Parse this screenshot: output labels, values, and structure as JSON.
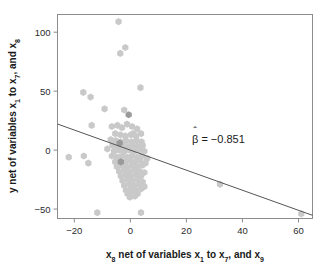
{
  "chart_data": {
    "type": "scatter",
    "title": "",
    "subtitle": "",
    "xlabel_parts": [
      "x",
      "8",
      " net of variables ",
      "x",
      "1",
      " to ",
      "x",
      "7",
      ", and ",
      "x",
      "9"
    ],
    "xlabel_text": "x8 net of variables x1 to x7, and x9",
    "ylabel_parts": [
      "y net of variables ",
      "x",
      "1",
      " to ",
      "x",
      "7",
      ", and ",
      "x",
      "8"
    ],
    "ylabel_text": "y net of variables x1 to x7, and x8",
    "xlim": [
      -26,
      65
    ],
    "ylim": [
      -58,
      115
    ],
    "xticks": [
      -20,
      0,
      20,
      40,
      60
    ],
    "xtick_labels": [
      "−20",
      "0",
      "20",
      "40",
      "60"
    ],
    "yticks": [
      -50,
      0,
      50,
      100
    ],
    "ytick_labels": [
      "−50",
      "0",
      "50",
      "100"
    ],
    "grid": false,
    "legend": "none",
    "marker_shape": "hexagon",
    "marker_color": "#c9c9c9",
    "marker_color_dark": "#9a9a9a",
    "frame_color": "#8c8c8c",
    "line_color": "#555555",
    "annotation": {
      "text": "β̂ = −0.851",
      "beta_symbol": "β",
      "hat": "̂",
      "equals": "=",
      "value": "−0.851",
      "x": 22,
      "y": 6
    },
    "fit_line": {
      "slope": -0.851,
      "intercept": 0.0,
      "x_start": -26,
      "y_start": 22.1,
      "x_end": 65,
      "y_end": -55.3
    },
    "points": [
      [
        -4.2,
        109
      ],
      [
        -3.6,
        82
      ],
      [
        -1.8,
        87
      ],
      [
        3.6,
        53
      ],
      [
        -16.8,
        49
      ],
      [
        -14.2,
        45
      ],
      [
        -9.2,
        35
      ],
      [
        -2.2,
        34
      ],
      [
        -13.8,
        21
      ],
      [
        -6.6,
        20
      ],
      [
        -4.6,
        21
      ],
      [
        -3.0,
        19
      ],
      [
        -1.2,
        22
      ],
      [
        0.6,
        20
      ],
      [
        2.4,
        18
      ],
      [
        1.0,
        14
      ],
      [
        -5.4,
        14
      ],
      [
        -3.6,
        13
      ],
      [
        -1.8,
        12
      ],
      [
        0.2,
        13
      ],
      [
        2.0,
        12
      ],
      [
        3.8,
        14
      ],
      [
        -7.0,
        9
      ],
      [
        -5.2,
        8
      ],
      [
        -3.4,
        7
      ],
      [
        -1.6,
        8
      ],
      [
        0.4,
        7
      ],
      [
        2.2,
        8
      ],
      [
        4.0,
        7
      ],
      [
        -6.4,
        4
      ],
      [
        -4.6,
        3
      ],
      [
        -2.8,
        4
      ],
      [
        -1.0,
        3
      ],
      [
        0.8,
        4
      ],
      [
        2.6,
        3
      ],
      [
        4.4,
        4
      ],
      [
        -8.2,
        1
      ],
      [
        -5.8,
        -1
      ],
      [
        -4.0,
        0
      ],
      [
        -2.2,
        -1
      ],
      [
        -0.4,
        0
      ],
      [
        1.4,
        -1
      ],
      [
        3.2,
        0
      ],
      [
        5.0,
        -1
      ],
      [
        -22.0,
        -6
      ],
      [
        -16.6,
        -5
      ],
      [
        -15.0,
        -11
      ],
      [
        -6.6,
        -5
      ],
      [
        -4.8,
        -6
      ],
      [
        -3.0,
        -5
      ],
      [
        -1.2,
        -6
      ],
      [
        0.6,
        -5
      ],
      [
        2.4,
        -6
      ],
      [
        4.2,
        -5
      ],
      [
        6.0,
        -7
      ],
      [
        -5.4,
        -10
      ],
      [
        -3.6,
        -9
      ],
      [
        -1.8,
        -10
      ],
      [
        0.0,
        -9
      ],
      [
        1.8,
        -10
      ],
      [
        3.6,
        -9
      ],
      [
        5.4,
        -11
      ],
      [
        -4.8,
        -14
      ],
      [
        -3.0,
        -13
      ],
      [
        -1.2,
        -14
      ],
      [
        0.6,
        -13
      ],
      [
        2.4,
        -14
      ],
      [
        4.2,
        -13
      ],
      [
        -4.0,
        -18
      ],
      [
        -2.2,
        -17
      ],
      [
        -0.4,
        -18
      ],
      [
        1.4,
        -17
      ],
      [
        3.2,
        -18
      ],
      [
        5.0,
        -19
      ],
      [
        -3.4,
        -22
      ],
      [
        -1.6,
        -21
      ],
      [
        0.2,
        -22
      ],
      [
        2.0,
        -21
      ],
      [
        3.8,
        -22
      ],
      [
        -2.8,
        -26
      ],
      [
        -1.0,
        -25
      ],
      [
        0.8,
        -26
      ],
      [
        2.6,
        -25
      ],
      [
        4.4,
        -27
      ],
      [
        -2.2,
        -30
      ],
      [
        -0.4,
        -29
      ],
      [
        1.4,
        -30
      ],
      [
        3.2,
        -29
      ],
      [
        5.0,
        -31
      ],
      [
        -1.6,
        -34
      ],
      [
        0.2,
        -33
      ],
      [
        2.0,
        -34
      ],
      [
        3.8,
        -33
      ],
      [
        -1.0,
        -37
      ],
      [
        0.8,
        -36
      ],
      [
        2.6,
        -37
      ],
      [
        -0.2,
        -40
      ],
      [
        1.6,
        -39
      ],
      [
        -11.8,
        -53
      ],
      [
        3.8,
        -53
      ],
      [
        32.0,
        -29
      ],
      [
        61.0,
        -54
      ]
    ],
    "dark_points": [
      [
        -3.8,
        6
      ],
      [
        -3.4,
        -10
      ],
      [
        -0.6,
        30
      ]
    ],
    "n_points": 104
  }
}
